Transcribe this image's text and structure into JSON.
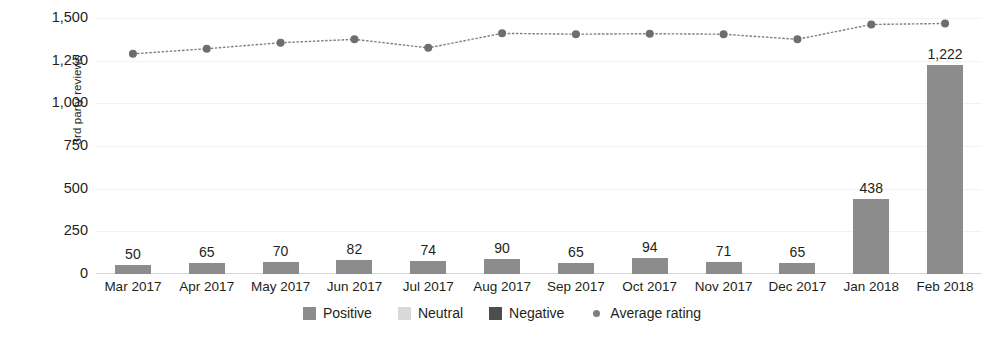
{
  "chart_data": {
    "type": "bar",
    "title": "",
    "subtitle": "",
    "xlabel": "",
    "ylabel": "3rd party reviews",
    "ylim": [
      0,
      1500
    ],
    "yticks": [
      "0",
      "250",
      "500",
      "750",
      "1,000",
      "1,250",
      "1,500"
    ],
    "ytick_values": [
      0,
      250,
      500,
      750,
      1000,
      1250,
      1500
    ],
    "grid": true,
    "legend_position": "bottom",
    "categories": [
      "Mar 2017",
      "Apr 2017",
      "May 2017",
      "Jun 2017",
      "Jul 2017",
      "Aug 2017",
      "Sep 2017",
      "Oct 2017",
      "Nov 2017",
      "Dec 2017",
      "Jan 2018",
      "Feb 2018"
    ],
    "series": [
      {
        "name": "Positive",
        "type": "bar",
        "color": "#8c8c8c",
        "values": [
          50,
          65,
          70,
          82,
          74,
          90,
          65,
          94,
          71,
          65,
          438,
          1222
        ],
        "labels": [
          "50",
          "65",
          "70",
          "82",
          "74",
          "90",
          "65",
          "94",
          "71",
          "65",
          "438",
          "1,222"
        ]
      },
      {
        "name": "Neutral",
        "type": "bar",
        "color": "#d9d9d9",
        "values": [
          0,
          0,
          0,
          0,
          0,
          0,
          0,
          0,
          0,
          0,
          0,
          0
        ],
        "labels": [
          "",
          "",
          "",
          "",
          "",
          "",
          "",
          "",
          "",
          "",
          "",
          ""
        ]
      },
      {
        "name": "Negative",
        "type": "bar",
        "color": "#4d4d4d",
        "values": [
          0,
          0,
          0,
          0,
          0,
          0,
          0,
          0,
          0,
          0,
          0,
          0
        ],
        "labels": [
          "",
          "",
          "",
          "",
          "",
          "",
          "",
          "",
          "",
          "",
          "",
          ""
        ]
      },
      {
        "name": "Average rating",
        "type": "line",
        "color": "#7f7f7f",
        "values": [
          1290,
          1320,
          1355,
          1375,
          1325,
          1410,
          1405,
          1408,
          1405,
          1375,
          1462,
          1468
        ]
      }
    ],
    "legend": [
      {
        "label": "Positive",
        "color": "#8c8c8c",
        "marker": "square"
      },
      {
        "label": "Neutral",
        "color": "#d9d9d9",
        "marker": "square"
      },
      {
        "label": "Negative",
        "color": "#4d4d4d",
        "marker": "square"
      },
      {
        "label": "Average rating",
        "color": "#7f7f7f",
        "marker": "dot"
      }
    ]
  }
}
